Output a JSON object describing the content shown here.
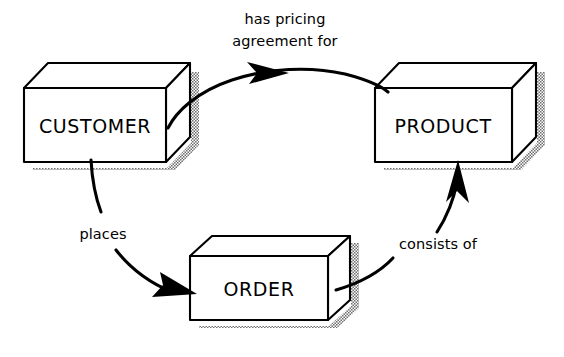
{
  "diagram": {
    "type": "entity-relationship-diagram",
    "style": "hand-drawn-isometric-boxes",
    "background_color": "#ffffff",
    "line_color": "#000000",
    "shadow_color": "#8a8a8a",
    "entities": [
      {
        "id": "customer",
        "label": "CUSTOMER",
        "position": "left",
        "front_face": {
          "x": 24,
          "y": 88,
          "width": 142,
          "height": 74
        },
        "depth_offset": {
          "dx": 24,
          "dy": -25
        }
      },
      {
        "id": "product",
        "label": "PRODUCT",
        "position": "right",
        "front_face": {
          "x": 375,
          "y": 88,
          "width": 137,
          "height": 74
        },
        "depth_offset": {
          "dx": 24,
          "dy": -25
        }
      },
      {
        "id": "order",
        "label": "ORDER",
        "position": "bottom-center",
        "front_face": {
          "x": 190,
          "y": 256,
          "width": 138,
          "height": 64
        },
        "depth_offset": {
          "dx": 22,
          "dy": -20
        }
      }
    ],
    "relationships": [
      {
        "id": "pricing-agreement",
        "label_line1": "has pricing",
        "label_line2": "agreement for",
        "from": "customer",
        "to": "product",
        "label_x": 285,
        "label_y1": 20,
        "label_y2": 42,
        "arrow_direction": "right"
      },
      {
        "id": "places",
        "label_line1": "places",
        "label_line2": "",
        "from": "customer",
        "to": "order",
        "label_x": 103,
        "label_y1": 235,
        "label_y2": 0,
        "arrow_direction": "down-right"
      },
      {
        "id": "consists-of",
        "label_line1": "consists of",
        "label_line2": "",
        "from": "order",
        "to": "product",
        "label_x": 438,
        "label_y1": 245,
        "label_y2": 0,
        "arrow_direction": "up"
      }
    ]
  }
}
